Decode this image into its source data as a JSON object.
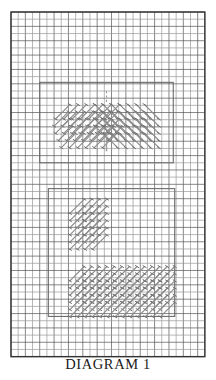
{
  "figure": {
    "caption": "DIAGRAM 1",
    "title": "DIAGRAM 1",
    "kind": "needlework-stitch-chart"
  },
  "colors": {
    "background": "#ffffff",
    "grid_line": "#555555",
    "grid_line_light": "#9a9a9a",
    "grid_border": "#333333",
    "stitch": "#8c8c8c",
    "stitch_dark": "#6f6f6f",
    "motif_box": "#6b6b6b",
    "axis_line": "#9c9c9c",
    "caption_text": "#1a1a1a"
  },
  "grid": {
    "origin_x": 11,
    "origin_y": 12,
    "cell": 7.18,
    "cols": 27,
    "rows": 48,
    "border_width": 1.4,
    "line_width": 0.7
  },
  "chart_data": {
    "type": "table",
    "title": "DIAGRAM 1",
    "xlabel": "",
    "ylabel": "",
    "axis_ranges": {
      "x": [
        0,
        27
      ],
      "y": [
        0,
        48
      ]
    },
    "grid": true,
    "legend": "none",
    "motifs": [
      {
        "name": "chevron-motif",
        "label": "upper chevron motif",
        "box": {
          "x": 4,
          "y": 9.8,
          "w": 18.6,
          "h": 11.2
        },
        "center_axis_col": 13.3,
        "symmetry": "mirrored-left-right",
        "stitch_rows": [
          {
            "row": 0,
            "y": 12.9,
            "left_start": 6.2,
            "left_count": 7,
            "right_count": 7,
            "right_start": 13.6
          },
          {
            "row": 1,
            "y": 13.9,
            "left_start": 6.0,
            "left_count": 7,
            "right_count": 7,
            "right_start": 13.6
          },
          {
            "row": 2,
            "y": 14.9,
            "left_start": 6.2,
            "left_count": 7,
            "right_count": 7,
            "right_start": 13.6
          },
          {
            "row": 3,
            "y": 15.9,
            "left_start": 6.6,
            "left_count": 7,
            "right_count": 7,
            "right_start": 13.6
          },
          {
            "row": 4,
            "y": 16.9,
            "left_start": 7.0,
            "left_count": 6,
            "right_count": 6,
            "right_start": 13.6
          }
        ],
        "stitch_span_cells": 2,
        "guide_line": {
          "dashed_top": true,
          "solid_bottom": true
        }
      },
      {
        "name": "l-shape-motif",
        "label": "lower L-shaped motif",
        "box": {
          "x": 5.2,
          "y": 24.6,
          "w": 17.6,
          "h": 17.8
        },
        "vertical_arm": {
          "x": 8.2,
          "y": 26.2,
          "w": 4.4,
          "h": 12.6
        },
        "horizontal_arm": {
          "x": 8.2,
          "y": 35.6,
          "w": 13.0,
          "h": 6.2
        },
        "stitch_span_cells": 2,
        "slant": "lower-left-to-upper-right"
      }
    ]
  }
}
